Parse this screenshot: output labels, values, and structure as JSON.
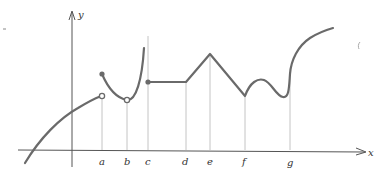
{
  "figure": {
    "axes": {
      "x_label": "x",
      "y_label": "y"
    },
    "tick_labels": [
      "a",
      "b",
      "c",
      "d",
      "e",
      "f",
      "g"
    ],
    "colors": {
      "curve": "#6a6a6a",
      "axis": "#555555",
      "guide": "#c4c4c4"
    },
    "features": [
      {
        "at": "a",
        "type": "jump discontinuity",
        "left_limit": "open circle",
        "value": "filled circle above"
      },
      {
        "at": "b",
        "type": "removable discontinuity",
        "marker": "open circle at minimum"
      },
      {
        "at": "c",
        "type": "infinite discontinuity",
        "marker": "vertical asymptote; filled circle starts new piece"
      },
      {
        "at": "d",
        "type": "corner"
      },
      {
        "at": "e",
        "type": "corner (peak)"
      },
      {
        "at": "f",
        "type": "corner (cusp-like minimum)"
      },
      {
        "at": "g",
        "type": "vertical tangent"
      }
    ]
  }
}
